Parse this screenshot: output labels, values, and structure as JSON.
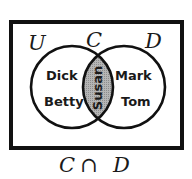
{
  "diagram": {
    "type": "venn",
    "universe_label": "U",
    "sets": [
      {
        "label": "C",
        "only_members": [
          "Dick",
          "Betty"
        ]
      },
      {
        "label": "D",
        "only_members": [
          "Mark",
          "Tom"
        ]
      }
    ],
    "intersection": {
      "members": [
        "Susan"
      ],
      "shaded": true
    },
    "caption": {
      "left": "C",
      "symbol": "∩",
      "right": "D"
    },
    "colors": {
      "stroke": "#111111",
      "shade": "#a9a9a9",
      "background": "#ffffff"
    }
  }
}
